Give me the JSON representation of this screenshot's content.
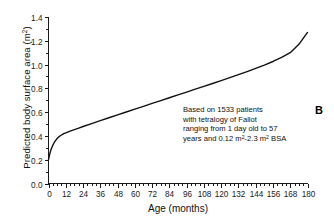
{
  "panel": {
    "label": "B"
  },
  "annotation": {
    "line1": "Based on 1533 patients",
    "line2": "with tetralogy of Fallot",
    "line3": "ranging from 1 day old to 57",
    "line4_pre": "years and 0.12 m",
    "line4_sup1": "2",
    "line4_mid": "-2.3 m",
    "line4_sup2": "2",
    "line4_post": " BSA"
  },
  "axis_titles": {
    "x": "Age (months)",
    "y_pre": "Predicted body surface area (m",
    "y_sup": "2",
    "y_post": ")"
  },
  "chart_data": {
    "type": "line",
    "title": "",
    "xlabel": "Age (months)",
    "ylabel": "Predicted body surface area (m2)",
    "xlim": [
      0,
      180
    ],
    "ylim": [
      0.0,
      1.4
    ],
    "xticks": [
      0,
      12,
      24,
      36,
      48,
      60,
      72,
      84,
      96,
      108,
      120,
      132,
      144,
      156,
      168,
      180
    ],
    "xtick_labels": [
      "0",
      "12",
      "24",
      "36",
      "48",
      "60",
      "72",
      "84",
      "96",
      "108",
      "120",
      "132",
      "144",
      "156",
      "168",
      "180"
    ],
    "x_minor_interval": 3,
    "yticks": [
      0.0,
      0.2,
      0.4,
      0.6,
      0.8,
      1.0,
      1.2,
      1.4
    ],
    "ytick_labels": [
      "0.0",
      "0.2",
      "0.4",
      "0.6",
      "0.8",
      "1.0",
      "1.2",
      "1.4"
    ],
    "y_minor_interval": 0.1,
    "grid": false,
    "legend": false,
    "line_color": "#111111",
    "series": [
      {
        "name": "Predicted body surface area",
        "x": [
          0,
          1,
          2,
          3,
          4,
          5,
          6,
          7,
          8,
          9,
          10,
          11,
          12,
          15,
          18,
          21,
          24,
          30,
          36,
          42,
          48,
          54,
          60,
          66,
          72,
          78,
          84,
          90,
          96,
          102,
          108,
          114,
          120,
          126,
          132,
          138,
          144,
          150,
          156,
          162,
          168,
          174,
          180
        ],
        "y": [
          0.2,
          0.255,
          0.293,
          0.322,
          0.345,
          0.363,
          0.378,
          0.39,
          0.4,
          0.408,
          0.415,
          0.421,
          0.426,
          0.44,
          0.453,
          0.466,
          0.479,
          0.504,
          0.529,
          0.553,
          0.577,
          0.601,
          0.625,
          0.649,
          0.673,
          0.697,
          0.721,
          0.745,
          0.769,
          0.793,
          0.817,
          0.841,
          0.865,
          0.89,
          0.915,
          0.941,
          0.968,
          0.996,
          1.026,
          1.06,
          1.1,
          1.17,
          1.27
        ]
      }
    ],
    "annotations": [
      {
        "text": "Based on 1533 patients with tetralogy of Fallot ranging from 1 day old to 57 years and 0.12 m2-2.3 m2 BSA",
        "x": 78,
        "y": 0.7
      },
      {
        "text": "B",
        "x": 186,
        "y": 0.72
      }
    ]
  }
}
